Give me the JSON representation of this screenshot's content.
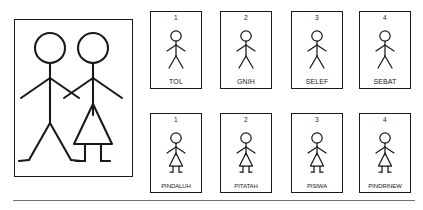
{
  "reference_panel": {
    "name": "reference-couple-panel",
    "figures": [
      {
        "id": "male",
        "gender": "male",
        "description": "male stick figure with straight legs"
      },
      {
        "id": "female",
        "gender": "female",
        "description": "female stick figure with triangular skirt"
      }
    ],
    "pose": "holding-hands"
  },
  "rows": [
    {
      "id": "row-male",
      "gender": "male",
      "cards": [
        {
          "number": "1",
          "label": "TOL"
        },
        {
          "number": "2",
          "label": "GNIH"
        },
        {
          "number": "3",
          "label": "SELEF"
        },
        {
          "number": "4",
          "label": "SEBAT"
        }
      ]
    },
    {
      "id": "row-female",
      "gender": "female",
      "cards": [
        {
          "number": "1",
          "label": "PINDALUH"
        },
        {
          "number": "2",
          "label": "PITATAH"
        },
        {
          "number": "3",
          "label": "PISIWA"
        },
        {
          "number": "4",
          "label": "PINDRINEW"
        }
      ]
    }
  ],
  "colors": {
    "ink": "#1a1a1a",
    "background": "#ffffff",
    "rule": "#6e7276"
  }
}
